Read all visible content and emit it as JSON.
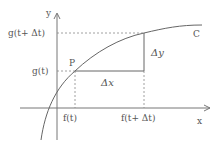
{
  "diagram": {
    "axes": {
      "x_label": "x",
      "y_label": "y"
    },
    "curve_label": "C",
    "point_label": "P",
    "x_ticks": {
      "f_t": "f(t)",
      "f_t_dt": "f(t+ Δt)"
    },
    "y_ticks": {
      "g_t": "g(t)",
      "g_t_dt": "g(t+ Δt)"
    },
    "increments": {
      "dx": "Δx",
      "dy": "Δy"
    },
    "colors": {
      "line": "#666666",
      "dashed": "#888888",
      "text": "#555555"
    }
  }
}
